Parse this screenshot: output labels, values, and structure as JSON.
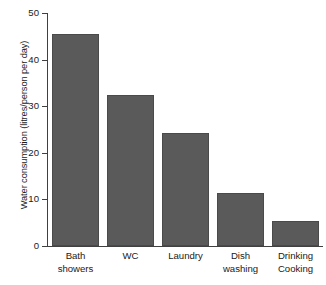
{
  "chart_data": {
    "type": "bar",
    "title": "",
    "xlabel": "",
    "ylabel": "Water consumption (litres/person per day)",
    "categories": [
      "Bath showers",
      "WC",
      "Laundry",
      "Dish washing",
      "Drinking Cooking"
    ],
    "category_lines": [
      [
        "Bath",
        "showers"
      ],
      [
        "WC",
        ""
      ],
      [
        "Laundry",
        ""
      ],
      [
        "Dish",
        "washing"
      ],
      [
        "Drinking",
        "Cooking"
      ]
    ],
    "values": [
      45.5,
      32.5,
      24.3,
      11.3,
      5.3
    ],
    "ylim": [
      0,
      50
    ],
    "yticks": [
      0,
      10,
      20,
      30,
      40,
      50
    ],
    "ytick_labels": [
      "0",
      "10",
      "20",
      "30",
      "40",
      "50"
    ],
    "grid": false,
    "legend": false,
    "bar_color": "#5a5a5a",
    "axis_color": "#404040",
    "background": "#ffffff"
  }
}
